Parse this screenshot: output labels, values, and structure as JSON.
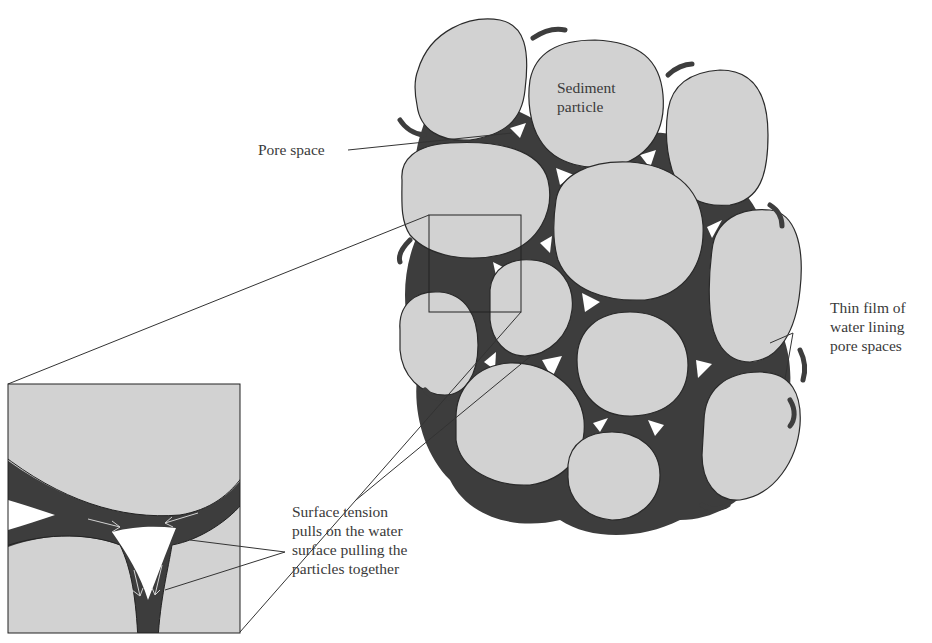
{
  "figure": {
    "colors": {
      "particle_fill": "#d2d2d2",
      "particle_outline": "#2a2a2a",
      "water_film": "#3d3d3d",
      "pore_space": "#ffffff",
      "label_text": "#3a3a3a",
      "background": "#ffffff"
    }
  },
  "labels": {
    "sediment_particle": "Sediment\nparticle",
    "pore_space": "Pore space",
    "thin_film": "Thin film of\nwater lining\npore spaces",
    "surface_tension": "Surface tension\npulls on the water\nsurface pulling the\nparticles together"
  },
  "inset": {
    "description": "Magnified view of a pore space between three particles",
    "arrows": "Surface tension arrows along water meniscus"
  }
}
